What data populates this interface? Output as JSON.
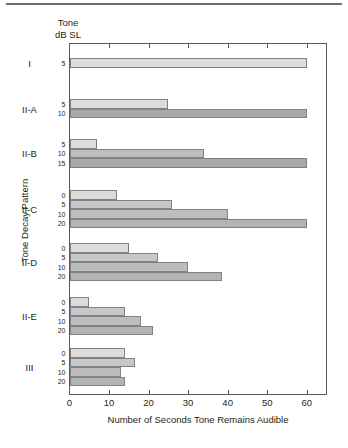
{
  "figure": {
    "column_header_line1": "Tone",
    "column_header_line2": "dB SL",
    "xaxis_title": "Number of Seconds Tone Remains Audible",
    "yaxis_title": "Tone Decay Pattern"
  },
  "chart_data": {
    "type": "bar",
    "orientation": "horizontal",
    "title": "",
    "xlabel": "Number of Seconds Tone Remains Audible",
    "ylabel": "Tone Decay Pattern",
    "xlim": [
      0,
      65
    ],
    "xticks": [
      0,
      10,
      20,
      30,
      40,
      50,
      60
    ],
    "xtick_labels": [
      "0",
      "10",
      "20",
      "30",
      "40",
      "50",
      "60"
    ],
    "grid": false,
    "legend": null,
    "series_label": "Tone dB SL",
    "groups": [
      {
        "pattern": "I",
        "bars": [
          {
            "db": "5",
            "value": 60,
            "color": "#dcdcda"
          }
        ]
      },
      {
        "pattern": "II-A",
        "bars": [
          {
            "db": "5",
            "value": 25,
            "color": "#dcdcda"
          },
          {
            "db": "10",
            "value": 60,
            "color": "#a7a9ac"
          }
        ]
      },
      {
        "pattern": "II-B",
        "bars": [
          {
            "db": "5",
            "value": 7,
            "color": "#dcdcda"
          },
          {
            "db": "10",
            "value": 34,
            "color": "#bcbdbf"
          },
          {
            "db": "15",
            "value": 60,
            "color": "#a7a9ac"
          }
        ]
      },
      {
        "pattern": "II-C",
        "bars": [
          {
            "db": "0",
            "value": 12,
            "color": "#dcdcda"
          },
          {
            "db": "5",
            "value": 26,
            "color": "#c7c8ca"
          },
          {
            "db": "10",
            "value": 40,
            "color": "#bcbdbf"
          },
          {
            "db": "20",
            "value": 60,
            "color": "#b2b3b5"
          }
        ]
      },
      {
        "pattern": "II-D",
        "bars": [
          {
            "db": "0",
            "value": 15,
            "color": "#dcdcda"
          },
          {
            "db": "5",
            "value": 22.5,
            "color": "#c7c8ca"
          },
          {
            "db": "10",
            "value": 30,
            "color": "#bcbdbf"
          },
          {
            "db": "20",
            "value": 38.5,
            "color": "#b2b3b5"
          }
        ]
      },
      {
        "pattern": "II-E",
        "bars": [
          {
            "db": "0",
            "value": 5,
            "color": "#dcdcda"
          },
          {
            "db": "5",
            "value": 14,
            "color": "#c7c8ca"
          },
          {
            "db": "10",
            "value": 18,
            "color": "#bcbdbf"
          },
          {
            "db": "20",
            "value": 21,
            "color": "#b2b3b5"
          }
        ]
      },
      {
        "pattern": "III",
        "bars": [
          {
            "db": "0",
            "value": 14,
            "color": "#dcdcda"
          },
          {
            "db": "5",
            "value": 16.5,
            "color": "#c7c8ca"
          },
          {
            "db": "10",
            "value": 13,
            "color": "#bcbdbf"
          },
          {
            "db": "20",
            "value": 14,
            "color": "#b2b3b5"
          }
        ]
      }
    ]
  }
}
